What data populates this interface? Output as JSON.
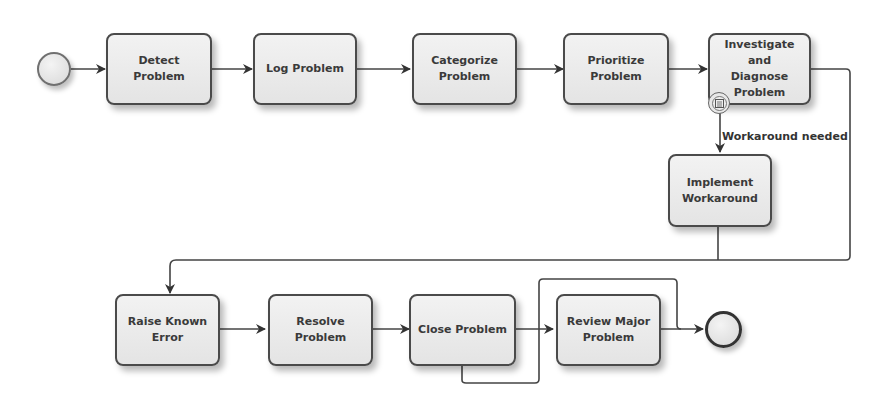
{
  "diagram": {
    "type": "BPMN process",
    "start_event": {
      "label": ""
    },
    "end_event": {
      "label": ""
    },
    "tasks": [
      {
        "id": "detect",
        "label": "Detect Problem"
      },
      {
        "id": "log",
        "label": "Log Problem"
      },
      {
        "id": "categorize",
        "label": "Categorize\nProblem"
      },
      {
        "id": "prioritize",
        "label": "Prioritize\nProblem"
      },
      {
        "id": "investigate",
        "label": "Investigate and\nDiagnose\nProblem"
      },
      {
        "id": "workaround",
        "label": "Implement\nWorkaround"
      },
      {
        "id": "raise",
        "label": "Raise Known\nError"
      },
      {
        "id": "resolve",
        "label": "Resolve\nProblem"
      },
      {
        "id": "close",
        "label": "Close Problem"
      },
      {
        "id": "review",
        "label": "Review Major\nProblem"
      }
    ],
    "boundary_event": {
      "attached_to": "investigate",
      "icon": "conditional-icon"
    },
    "conditional_flow_label": "Workaround needed",
    "flows": [
      {
        "from": "start",
        "to": "detect"
      },
      {
        "from": "detect",
        "to": "log"
      },
      {
        "from": "log",
        "to": "categorize"
      },
      {
        "from": "categorize",
        "to": "prioritize"
      },
      {
        "from": "prioritize",
        "to": "investigate"
      },
      {
        "from": "investigate-boundary",
        "to": "workaround",
        "label": "Workaround needed"
      },
      {
        "from": "investigate",
        "to": "raise"
      },
      {
        "from": "workaround",
        "to": "raise"
      },
      {
        "from": "raise",
        "to": "resolve"
      },
      {
        "from": "resolve",
        "to": "close"
      },
      {
        "from": "close",
        "to": "review"
      },
      {
        "from": "close",
        "to": "end"
      },
      {
        "from": "review",
        "to": "end"
      }
    ]
  }
}
